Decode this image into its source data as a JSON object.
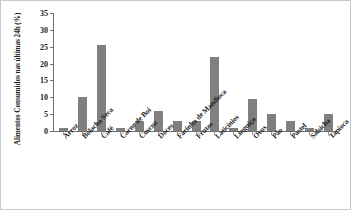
{
  "chart_data": {
    "type": "bar",
    "title": "",
    "xlabel": "",
    "ylabel": "Alimentos Consumidos nas últimas 24h (%)",
    "ylim": [
      0,
      35
    ],
    "yticks": [
      0,
      5,
      10,
      15,
      20,
      25,
      30,
      35
    ],
    "grid": false,
    "legend": null,
    "bar_color": "#808080",
    "categories": [
      "Arroz",
      "Bolacha Seca",
      "Café",
      "Carne de Boi",
      "Cuscuz",
      "Doces",
      "Farinha de Mandioca",
      "Frutas",
      "Laticínios",
      "Linguiça",
      "Ovos",
      "Pão",
      "Pastel",
      "Salsicha",
      "Tapioca"
    ],
    "values": [
      1,
      10,
      25.5,
      1,
      3,
      6,
      3,
      3,
      22,
      1,
      9.5,
      5,
      3,
      1,
      5
    ]
  }
}
